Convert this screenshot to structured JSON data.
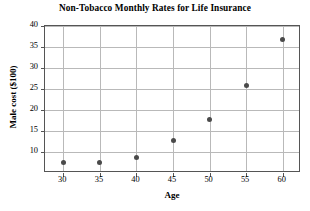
{
  "chart_data": {
    "type": "scatter",
    "title": "Non-Tobacco Monthly Rates for Life Insurance",
    "xlabel": "Age",
    "ylabel": "Male cost ($100)",
    "x": [
      30,
      35,
      40,
      45,
      50,
      55,
      60
    ],
    "values": [
      7.4,
      7.4,
      8.8,
      12.8,
      17.7,
      25.8,
      36.8
    ],
    "series": [
      {
        "name": "Male cost",
        "points": [
          {
            "x": 30,
            "y": 7.4
          },
          {
            "x": 35,
            "y": 7.4
          },
          {
            "x": 40,
            "y": 8.8
          },
          {
            "x": 45,
            "y": 12.8
          },
          {
            "x": 50,
            "y": 17.7
          },
          {
            "x": 55,
            "y": 25.8
          },
          {
            "x": 60,
            "y": 36.8
          }
        ]
      }
    ],
    "xlim": [
      27.5,
      62.5
    ],
    "ylim": [
      5,
      40
    ],
    "xticks": [
      30,
      35,
      40,
      45,
      50,
      55,
      60
    ],
    "yticks": [
      10,
      15,
      20,
      25,
      30,
      35,
      40
    ],
    "grid": true,
    "legend": false,
    "marker_color": "#4a4a4a",
    "grid_color": "#b9b9b9",
    "axis_color": "#555555"
  }
}
